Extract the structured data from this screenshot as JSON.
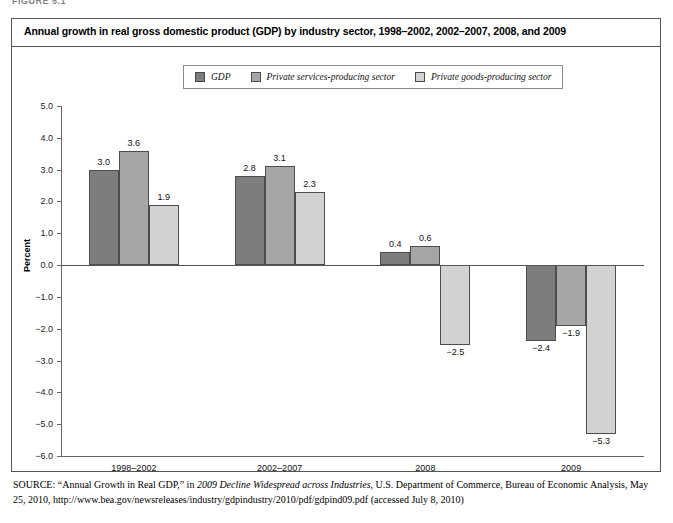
{
  "figure": {
    "label": "FIGURE 5.1",
    "title": "Annual growth in real gross domestic product (GDP) by industry sector, 1998–2002, 2002–2007, 2008, and 2009"
  },
  "source": {
    "prefix": "SOURCE:",
    "part1": " “Annual Growth in Real GDP,” in ",
    "italic1": "2009 Decline Widespread across Industries",
    "part2": ", U.S. Department of Commerce, Bureau of Economic Analysis, May 25, 2010, http://www.bea.gov/newsreleases/industry/gdpindustry/2010/pdf/gdpind09.pdf (accessed July 8, 2010)"
  },
  "colors": {
    "gdp": "#7d7d7d",
    "services": "#a6a6a6",
    "goods": "#d2d2d2",
    "border": "#4d4d4d",
    "axis": "#666666",
    "frame": "#555555"
  },
  "chart_data": {
    "type": "bar",
    "title": "Annual growth in real gross domestic product (GDP) by industry sector, 1998–2002, 2002–2007, 2008, and 2009",
    "xlabel": "",
    "ylabel": "Percent",
    "ylim": [
      -6.0,
      5.0
    ],
    "ytick_labels": [
      "5.0",
      "4.0",
      "3.0",
      "2.0",
      "1.0",
      "0.0",
      "−1.0",
      "−2.0",
      "−3.0",
      "−4.0",
      "−5.0",
      "−6.0"
    ],
    "yticks": [
      5.0,
      4.0,
      3.0,
      2.0,
      1.0,
      0.0,
      -1.0,
      -2.0,
      -3.0,
      -4.0,
      -5.0,
      -6.0
    ],
    "grid": false,
    "legend_position": "top-center",
    "categories": [
      "1998–2002",
      "2002–2007",
      "2008",
      "2009"
    ],
    "series": [
      {
        "name": "GDP",
        "color": "#7d7d7d",
        "values": [
          3.0,
          2.8,
          0.4,
          -2.4
        ],
        "labels": [
          "3.0",
          "2.8",
          "0.4",
          "−2.4"
        ]
      },
      {
        "name": "Private services-producing sector",
        "color": "#a6a6a6",
        "values": [
          3.6,
          3.1,
          0.6,
          -1.9
        ],
        "labels": [
          "3.6",
          "3.1",
          "0.6",
          "−1.9"
        ]
      },
      {
        "name": "Private goods-producing sector",
        "color": "#d2d2d2",
        "values": [
          1.9,
          2.3,
          -2.5,
          -5.3
        ],
        "labels": [
          "1.9",
          "2.3",
          "−2.5",
          "−5.3"
        ]
      }
    ]
  }
}
